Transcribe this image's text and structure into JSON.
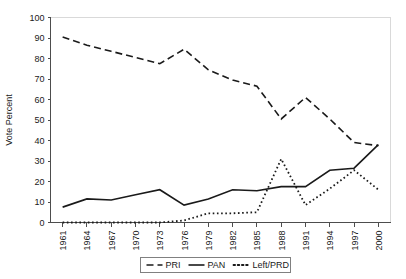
{
  "chart_data": {
    "type": "line",
    "title": "",
    "xlabel": "",
    "ylabel": "Vote Percent",
    "ylim": [
      0,
      100
    ],
    "ytick_step": 10,
    "yticks": [
      0,
      10,
      20,
      30,
      40,
      50,
      60,
      70,
      80,
      90,
      100
    ],
    "grid": false,
    "legend_position": "bottom",
    "categories": [
      "1961",
      "1964",
      "1967",
      "1970",
      "1973",
      "1976",
      "1979",
      "1982",
      "1985",
      "1988",
      "1991",
      "1994",
      "1997",
      "2000"
    ],
    "series": [
      {
        "name": "PRI",
        "style": "dashed",
        "color": "#1a1a1a",
        "values": [
          90.5,
          86.5,
          83.5,
          80.5,
          77.5,
          84.5,
          74.5,
          69.5,
          66.5,
          50.5,
          61.0,
          50.5,
          39.0,
          37.5
        ]
      },
      {
        "name": "PAN",
        "style": "solid",
        "color": "#1a1a1a",
        "values": [
          7.5,
          11.5,
          11.0,
          13.5,
          16.0,
          8.5,
          11.5,
          16.0,
          15.5,
          17.5,
          17.5,
          25.5,
          26.5,
          38.0
        ]
      },
      {
        "name": "Left/PRD",
        "style": "dotted",
        "color": "#1a1a1a",
        "values": [
          0.0,
          0.0,
          0.0,
          0.0,
          0.0,
          1.0,
          4.5,
          4.5,
          5.0,
          31.0,
          8.5,
          16.5,
          25.5,
          16.0
        ]
      }
    ]
  },
  "legend": {
    "items": [
      {
        "label": "PRI",
        "style": "dashed"
      },
      {
        "label": "PAN",
        "style": "solid"
      },
      {
        "label": "Left/PRD",
        "style": "dotted"
      }
    ]
  }
}
